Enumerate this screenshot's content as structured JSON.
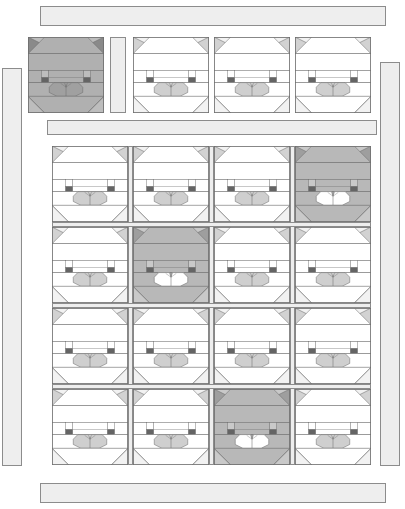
{
  "artwork": {
    "title": "Cat Block Quilt Layout",
    "type": "quilt-diagram",
    "canvas": {
      "width": 405,
      "height": 509,
      "background": "#ffffff"
    }
  },
  "palette": {
    "background": "#ffffff",
    "outline": "#6e6e6e",
    "outline_light": "#9a9a9a",
    "sashing_fill": "#eeeeee",
    "sashing_border": "#8c8c8c",
    "light_body": "#ffffff",
    "light_ear": "#d2d2d2",
    "light_muzzle": "#cfcfcf",
    "light_band": "#f2f2f2",
    "eye_dark": "#646464",
    "dark_body": "#b8b8b8",
    "dark_ear": "#9e9e9e",
    "dark_muzzle": "#ffffff",
    "dark_band": "#c9c9c9",
    "sample_body": "#b0b0b0",
    "sample_ear": "#8a8a8a",
    "sample_muzzle": "#a0a0a0",
    "sample_band": "#bdbdbd"
  },
  "borders": [
    {
      "name": "top-border-strip",
      "x": 40,
      "y": 6,
      "w": 346,
      "h": 20,
      "orientation": "horizontal"
    },
    {
      "name": "left-border-strip",
      "x": 2,
      "y": 68,
      "w": 20,
      "h": 398,
      "orientation": "vertical"
    },
    {
      "name": "right-border-strip",
      "x": 380,
      "y": 62,
      "w": 20,
      "h": 404,
      "orientation": "vertical"
    },
    {
      "name": "bottom-border-strip",
      "x": 40,
      "y": 483,
      "w": 346,
      "h": 20,
      "orientation": "horizontal"
    },
    {
      "name": "inner-top-sashing",
      "x": 47,
      "y": 120,
      "w": 330,
      "h": 15,
      "orientation": "horizontal"
    },
    {
      "name": "sample-divider-strip",
      "x": 110,
      "y": 37,
      "w": 16,
      "h": 76,
      "orientation": "vertical"
    }
  ],
  "sample_row": {
    "name": "sample-cat-row",
    "label": "top accent row",
    "blocks": [
      {
        "id": "sample-cat",
        "x": 28,
        "y": 37,
        "size": 76,
        "shade": "sample"
      },
      {
        "id": "top-cat-1",
        "x": 133,
        "y": 37,
        "size": 76,
        "shade": "light"
      },
      {
        "id": "top-cat-2",
        "x": 214,
        "y": 37,
        "size": 76,
        "shade": "light"
      },
      {
        "id": "top-cat-3",
        "x": 295,
        "y": 37,
        "size": 76,
        "shade": "light"
      }
    ]
  },
  "main_grid": {
    "name": "main-cat-grid",
    "rows": 4,
    "cols": 4,
    "block_size": 76,
    "origin": {
      "x": 52,
      "y": 146
    },
    "gap_x": 81,
    "gap_y": 81,
    "sashing_width": 5,
    "cells": [
      {
        "row": 0,
        "col": 0,
        "shade": "light"
      },
      {
        "row": 0,
        "col": 1,
        "shade": "light"
      },
      {
        "row": 0,
        "col": 2,
        "shade": "light"
      },
      {
        "row": 0,
        "col": 3,
        "shade": "dark"
      },
      {
        "row": 1,
        "col": 0,
        "shade": "light"
      },
      {
        "row": 1,
        "col": 1,
        "shade": "dark"
      },
      {
        "row": 1,
        "col": 2,
        "shade": "light"
      },
      {
        "row": 1,
        "col": 3,
        "shade": "light"
      },
      {
        "row": 2,
        "col": 0,
        "shade": "light"
      },
      {
        "row": 2,
        "col": 1,
        "shade": "light"
      },
      {
        "row": 2,
        "col": 2,
        "shade": "light"
      },
      {
        "row": 2,
        "col": 3,
        "shade": "light"
      },
      {
        "row": 3,
        "col": 0,
        "shade": "light"
      },
      {
        "row": 3,
        "col": 1,
        "shade": "light"
      },
      {
        "row": 3,
        "col": 2,
        "shade": "dark"
      },
      {
        "row": 3,
        "col": 3,
        "shade": "light"
      }
    ]
  },
  "counts": {
    "total_cat_blocks": 20,
    "dark_cat_blocks": 3,
    "sample_blocks": 1,
    "light_cat_blocks": 16,
    "border_strips": 6
  }
}
